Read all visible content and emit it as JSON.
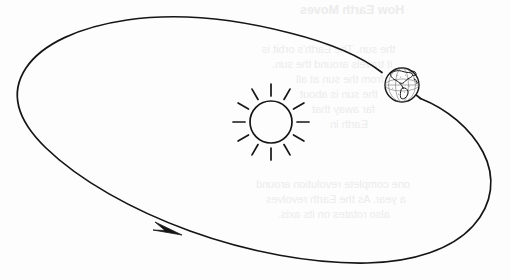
{
  "document": {
    "type": "scanned-science-textbook-figure",
    "title": "Earth's orbit around the Sun",
    "background_color": "#fdfdfd",
    "ink_color": "#151515"
  },
  "figure": {
    "name": "earth-orbit-diagram",
    "width": 510,
    "height": 280,
    "orbit": {
      "label": "elliptical orbit path",
      "shape": "ellipse",
      "center_x": 253,
      "center_y": 140,
      "radius_x": 240,
      "radius_y": 110,
      "rotation_degrees": -13,
      "stroke_color": "#151515",
      "stroke_width": 1.7
    },
    "direction_arrow": {
      "label": "orbit direction arrow",
      "tip_x": 182,
      "tip_y": 235,
      "direction": "counterclockwise",
      "fill_color": "#151515"
    },
    "sun": {
      "label": "Sun",
      "center_x": 271,
      "center_y": 122,
      "radius": 21,
      "ray_count": 12,
      "ray_inner_radius": 26,
      "ray_outer_radius": 38,
      "stroke_color": "#151515"
    },
    "earth": {
      "label": "Earth",
      "center_x": 402,
      "center_y": 85,
      "radius": 17,
      "depicted_hemisphere": "Americas",
      "stroke_color": "#151515"
    }
  },
  "bleed_through": {
    "note": "faint mirrored show-through text from the reverse page",
    "color": "#ececec",
    "lines": [
      {
        "text": "How Earth Moves",
        "x": 300,
        "y": 3,
        "style": "title"
      },
      {
        "text": "the sun. The Earth's orbit is",
        "x": 262,
        "y": 43,
        "style": "line"
      },
      {
        "text": "it travels around the sun.",
        "x": 272,
        "y": 58,
        "style": "line"
      },
      {
        "text": "from the sun at all",
        "x": 296,
        "y": 73,
        "style": "line"
      },
      {
        "text": "the sun is about",
        "x": 300,
        "y": 88,
        "style": "line"
      },
      {
        "text": "far away that",
        "x": 312,
        "y": 103,
        "style": "line"
      },
      {
        "text": "Earth in",
        "x": 330,
        "y": 118,
        "style": "line"
      },
      {
        "text": "one complete revolution around",
        "x": 256,
        "y": 178,
        "style": "line"
      },
      {
        "text": "a year. As the Earth revolves",
        "x": 266,
        "y": 193,
        "style": "line"
      },
      {
        "text": "also rotates on its axis.",
        "x": 278,
        "y": 208,
        "style": "line"
      }
    ]
  }
}
